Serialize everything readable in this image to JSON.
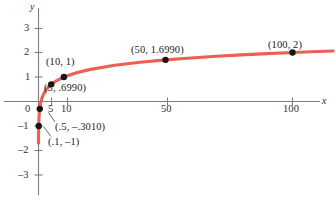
{
  "chart_data": {
    "type": "line",
    "title": "",
    "xlabel": "x",
    "ylabel": "y",
    "function": "y = log x",
    "xlim": [
      -6,
      118
    ],
    "ylim": [
      -3.6,
      3.4
    ],
    "grid": false,
    "legend": "none",
    "x_ticks": [
      {
        "value": 0,
        "label": "0"
      },
      {
        "value": 5,
        "label": "5"
      },
      {
        "value": 10,
        "label": "10"
      },
      {
        "value": 50,
        "label": "50"
      },
      {
        "value": 100,
        "label": "100"
      }
    ],
    "y_ticks": [
      {
        "value": 3,
        "label": "3"
      },
      {
        "value": 2,
        "label": "2"
      },
      {
        "value": 1,
        "label": "1"
      },
      {
        "value": -1,
        "label": "–1"
      },
      {
        "value": -2,
        "label": "–2"
      },
      {
        "value": -3,
        "label": "–3"
      }
    ],
    "points": [
      {
        "x": 0.1,
        "y": -1,
        "label": "(.1, –1)"
      },
      {
        "x": 0.5,
        "y": -0.301,
        "label": "(.5, –.3010)"
      },
      {
        "x": 5,
        "y": 0.699,
        "label": "(5, .6990)"
      },
      {
        "x": 10,
        "y": 1,
        "label": "(10, 1)"
      },
      {
        "x": 50,
        "y": 1.699,
        "label": "(50, 1.6990)"
      },
      {
        "x": 100,
        "y": 2,
        "label": "(100, 2)"
      }
    ],
    "series": [
      {
        "name": "y = log x",
        "x": [
          0.02,
          0.04,
          0.06,
          0.08,
          0.1,
          0.15,
          0.2,
          0.3,
          0.5,
          0.8,
          1,
          1.5,
          2,
          3,
          4,
          5,
          7,
          10,
          15,
          20,
          30,
          40,
          50,
          60,
          70,
          80,
          90,
          100,
          110,
          116
        ],
        "y": [
          -1.699,
          -1.398,
          -1.222,
          -1.097,
          -1.0,
          -0.824,
          -0.699,
          -0.523,
          -0.301,
          -0.097,
          0,
          0.176,
          0.301,
          0.477,
          0.602,
          0.699,
          0.845,
          1.0,
          1.176,
          1.301,
          1.477,
          1.602,
          1.699,
          1.778,
          1.845,
          1.903,
          1.954,
          2.0,
          2.041,
          2.064
        ]
      }
    ],
    "colors": {
      "curve": "#ec5f52",
      "axis": "#7d7d7d",
      "point": "#161616",
      "text": "#2c2c2c",
      "background": "#ffffff"
    }
  },
  "labels": {
    "y_axis_name": "y",
    "x_axis_name": "x",
    "tick_x_0": "0",
    "tick_x_5": "5",
    "tick_x_10": "10",
    "tick_x_50": "50",
    "tick_x_100": "100",
    "tick_y_3": "3",
    "tick_y_2": "2",
    "tick_y_1": "1",
    "tick_y_n1": "–1",
    "tick_y_n2": "–2",
    "tick_y_n3": "–3",
    "pt_10_1": "(10, 1)",
    "pt_5_699": "(5, .6990)",
    "pt_50_1699": "(50, 1.6990)",
    "pt_100_2": "(100, 2)",
    "pt_5_3010": "(.5, –.3010)",
    "pt_1_n1": "(.1, –1)"
  }
}
